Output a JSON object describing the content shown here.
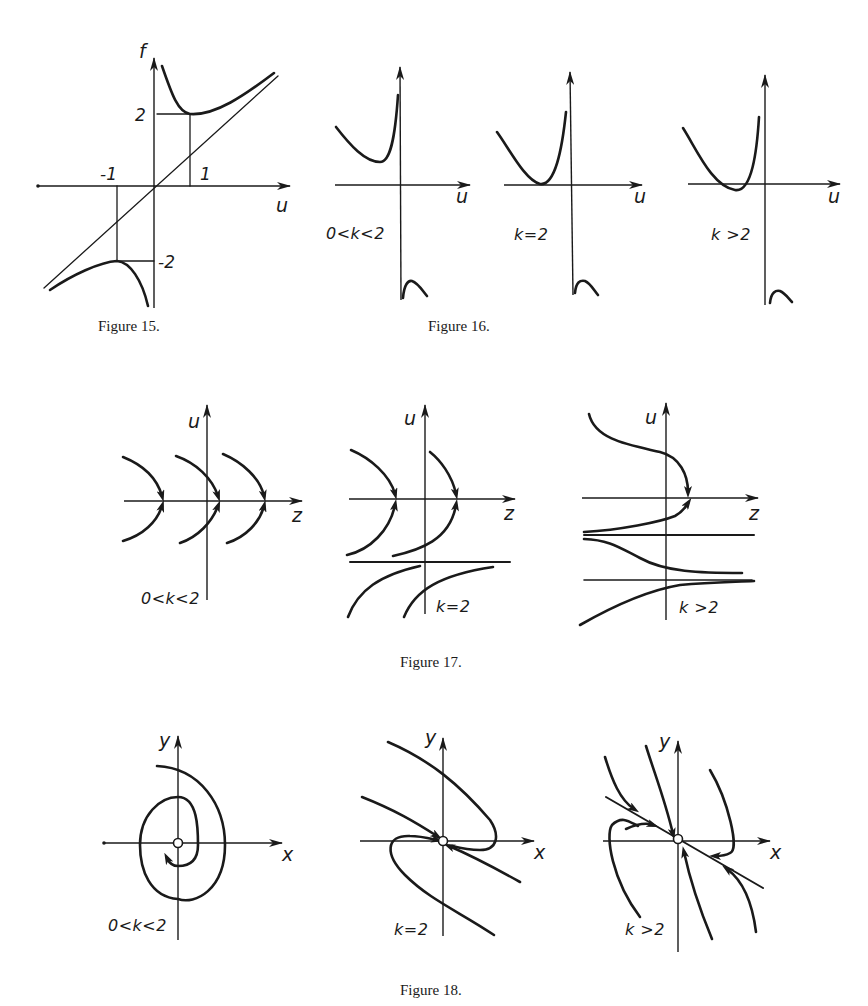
{
  "figures": {
    "fig15": {
      "caption": "Figure 15.",
      "axis_labels": {
        "vertical": "f",
        "horizontal": "u"
      },
      "tick_labels": {
        "u_neg": "-1",
        "u_pos": "1",
        "f_pos": "2",
        "f_neg": "-2"
      }
    },
    "fig16": {
      "caption": "Figure 16.",
      "panels": [
        {
          "condition": "0<k<2",
          "axis_label": "u"
        },
        {
          "condition": "k=2",
          "axis_label": "u"
        },
        {
          "condition": "k >2",
          "axis_label": "u"
        }
      ]
    },
    "fig17": {
      "caption": "Figure 17.",
      "panels": [
        {
          "condition": "0<k<2",
          "vertical_label": "u",
          "horizontal_label": "z"
        },
        {
          "condition": "k=2",
          "vertical_label": "u",
          "horizontal_label": "z"
        },
        {
          "condition": "k >2",
          "vertical_label": "u",
          "horizontal_label": "z"
        }
      ]
    },
    "fig18": {
      "caption": "Figure 18.",
      "panels": [
        {
          "condition": "0<k<2",
          "vertical_label": "y",
          "horizontal_label": "x"
        },
        {
          "condition": "k=2",
          "vertical_label": "y",
          "horizontal_label": "x"
        },
        {
          "condition": "k >2",
          "vertical_label": "y",
          "horizontal_label": "x"
        }
      ]
    }
  }
}
